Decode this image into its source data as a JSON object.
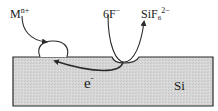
{
  "diagram": {
    "colors": {
      "substrate_fill": "#d9d9d9",
      "stroke": "#2a2a2a",
      "background": "#ffffff"
    },
    "labels": {
      "metal_ion": {
        "base": "M",
        "sup": "n+"
      },
      "fluoride": {
        "base": "6F",
        "sup": "−"
      },
      "product": {
        "base": "SiF",
        "sub": "6",
        "sup": "2−"
      },
      "electron": {
        "base": "e",
        "sup": "-"
      },
      "substrate": "Si"
    },
    "nodes": [
      {
        "id": "metal_ion",
        "text": "Mn+"
      },
      {
        "id": "metal_particle",
        "text": ""
      },
      {
        "id": "fluoride",
        "text": "6F−"
      },
      {
        "id": "product",
        "text": "SiF6 2−"
      },
      {
        "id": "electron",
        "text": "e−"
      },
      {
        "id": "substrate",
        "text": "Si"
      }
    ],
    "edges": [
      {
        "from": "metal_ion",
        "to": "metal_particle",
        "label": "reduction"
      },
      {
        "from": "fluoride",
        "to": "product",
        "label": "etch pit dissolution"
      },
      {
        "from": "substrate",
        "to": "metal_particle",
        "label": "e−"
      }
    ]
  }
}
